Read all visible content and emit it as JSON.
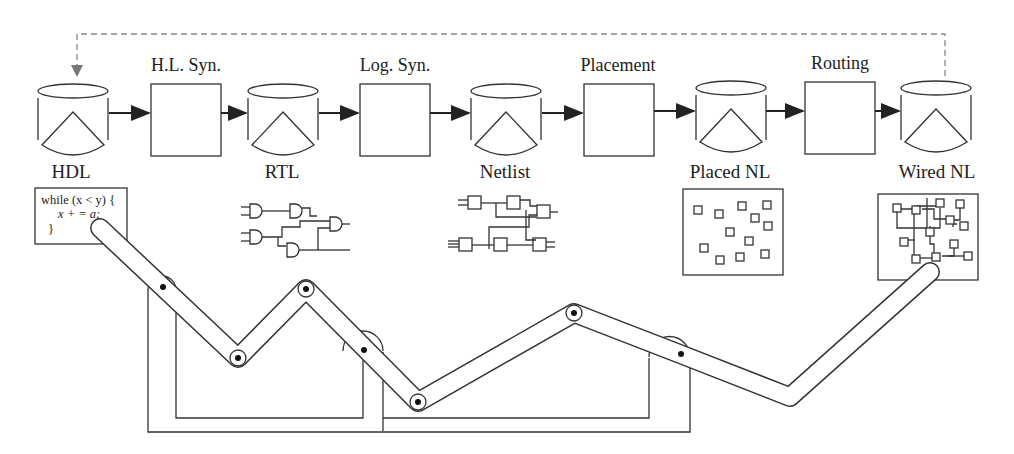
{
  "diagram": {
    "stages": [
      {
        "label": "H.L. Syn."
      },
      {
        "label": "Log. Syn."
      },
      {
        "label": "Placement"
      },
      {
        "label": "Routing"
      }
    ],
    "databases": [
      {
        "label": "HDL"
      },
      {
        "label": "RTL"
      },
      {
        "label": "Netlist"
      },
      {
        "label": "Placed NL"
      },
      {
        "label": "Wired NL"
      }
    ],
    "code": {
      "line1": "while (x < y) {",
      "line2": "x + = a;",
      "line3": "}"
    },
    "feedback": "dashed feedback loop from Wired NL to HDL",
    "colors": {
      "stroke": "#333333",
      "dashed": "#888888",
      "background": "#ffffff"
    }
  }
}
